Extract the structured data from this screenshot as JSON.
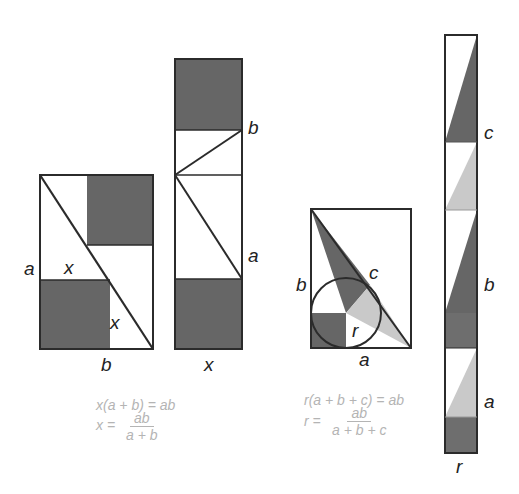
{
  "colors": {
    "stroke": "#2b2b2b",
    "dark_fill": "#666666",
    "light_fill": "#c9c9c9",
    "equation_text": "#b4b4b4"
  },
  "figure1": {
    "labels": {
      "a": "a",
      "x_top": "x",
      "x_bottom": "x",
      "b": "b"
    }
  },
  "figure2": {
    "labels": {
      "b": "b",
      "a": "a",
      "x": "x"
    }
  },
  "figure3": {
    "labels": {
      "b": "b",
      "c": "c",
      "r": "r",
      "a": "a"
    }
  },
  "figure4": {
    "labels": {
      "c": "c",
      "b": "b",
      "a": "a",
      "r": "r"
    }
  },
  "equations_left": {
    "line1": "x(a + b) = ab",
    "line2_lhs": "x =",
    "line2_num": "ab",
    "line2_den": "a + b"
  },
  "equations_right": {
    "line1": "r(a + b + c) = ab",
    "line2_lhs": "r =",
    "line2_num": "ab",
    "line2_den": "a + b + c"
  }
}
